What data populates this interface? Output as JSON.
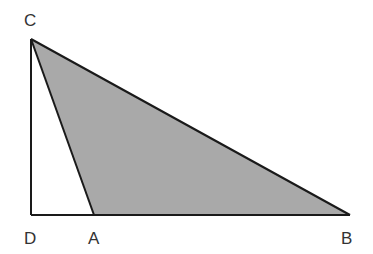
{
  "diagram": {
    "type": "geometry",
    "colors": {
      "shade": "#a9a9a9",
      "stroke": "#1a1a1a",
      "label": "#333333"
    },
    "points": {
      "C": {
        "label": "C",
        "x": 31,
        "y": 39
      },
      "D": {
        "label": "D",
        "x": 31,
        "y": 215
      },
      "A": {
        "label": "A",
        "x": 94,
        "y": 215
      },
      "B": {
        "label": "B",
        "x": 350,
        "y": 215
      }
    },
    "labels": {
      "C": "C",
      "D": "D",
      "A": "A",
      "B": "B"
    },
    "shaded_region": "triangle CAB",
    "segments": [
      "CD",
      "DB",
      "CA",
      "CB"
    ]
  }
}
